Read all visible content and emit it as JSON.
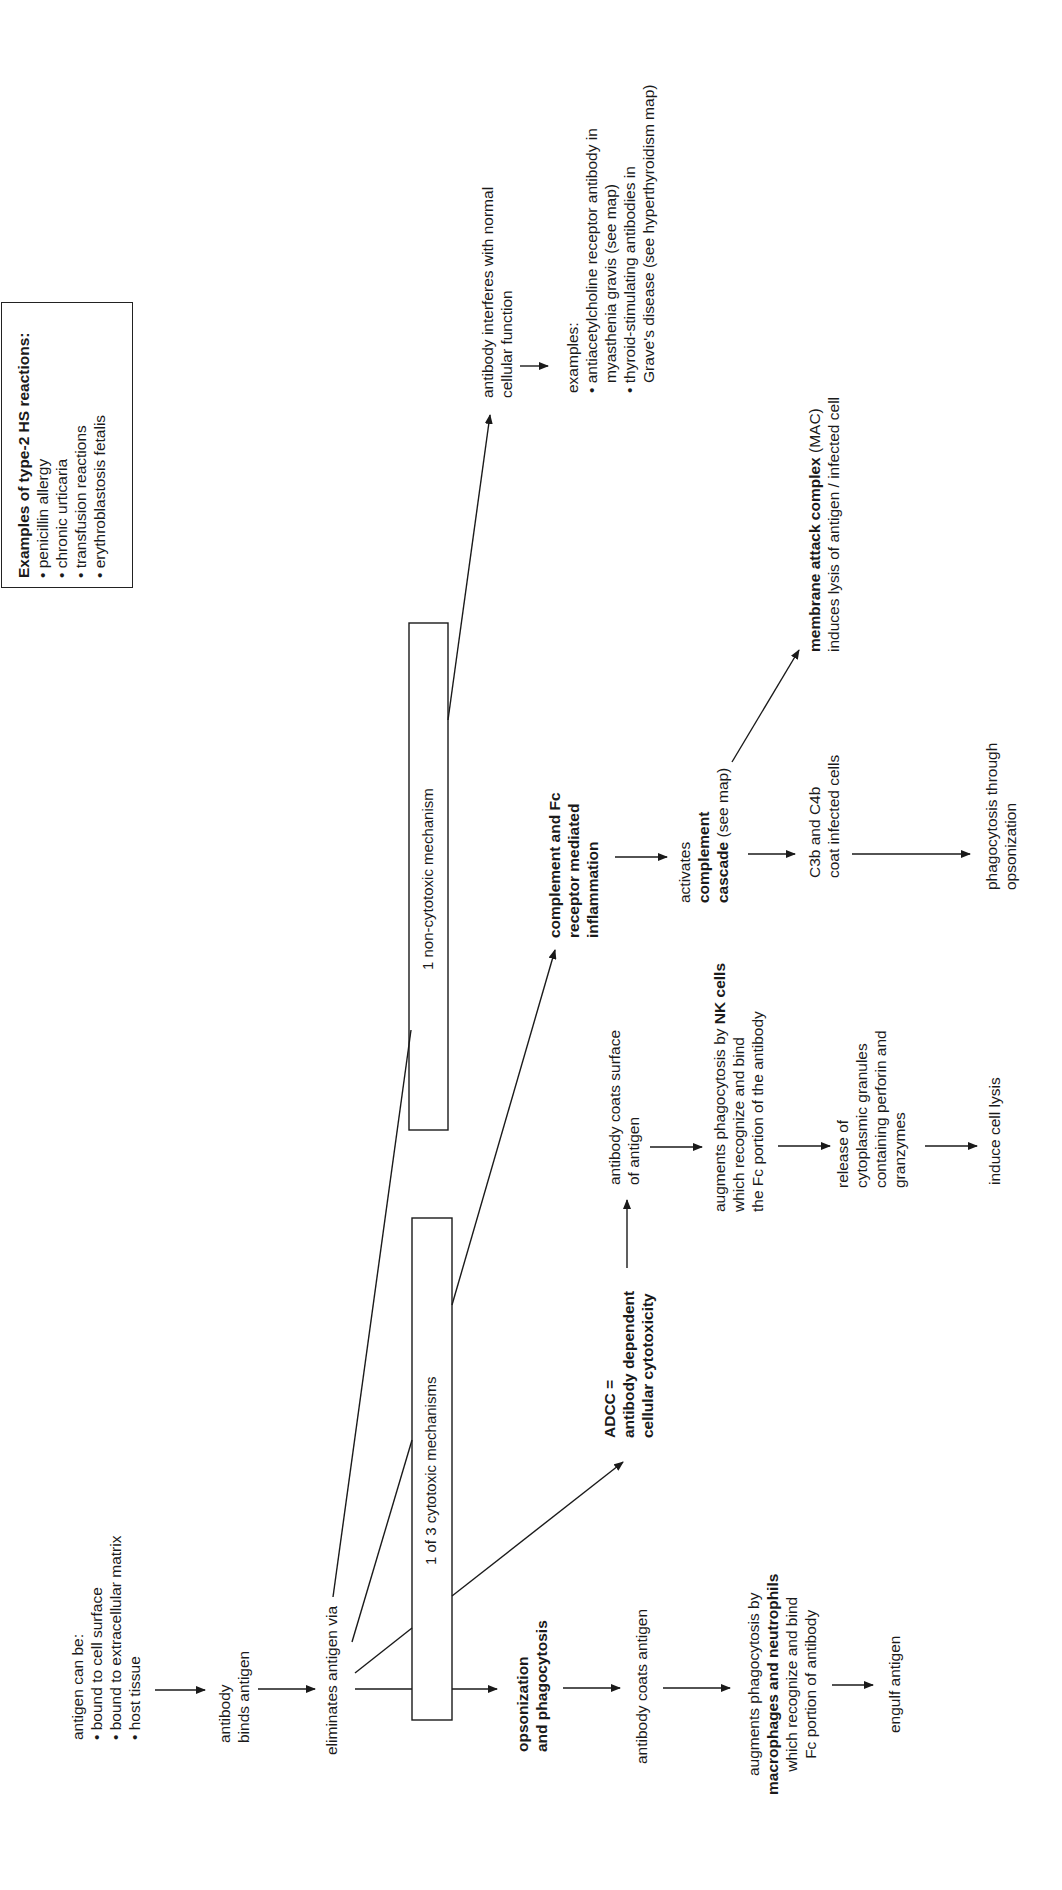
{
  "examples_box": {
    "title": "Examples of type-2 HS reactions:",
    "items": [
      "• penicillin allergy",
      "• chronic urticaria",
      "• transfusion reactions",
      "• erythroblastosis fetalis"
    ]
  },
  "start": {
    "title": "antigen can be:",
    "items": [
      "• bound to cell surface",
      "• bound to extracellular matrix",
      "• host tissue"
    ]
  },
  "binds": {
    "line1": "antibody",
    "line2": "binds antigen"
  },
  "eliminates": {
    "label": "eliminates antigen via"
  },
  "boxes": {
    "cytotoxic": "1 of 3 cytotoxic mechanisms",
    "noncytotoxic": "1 non-cytotoxic mechanism"
  },
  "opsonization": {
    "title1": "opsonization",
    "title2": "and phagocytosis",
    "step1": "antibody coats antigen",
    "step2_line1": "augments phagocytosis by",
    "step2_bold": "macrophages and neutrophils",
    "step2_line3": "which recognize and bind",
    "step2_line4": "Fc portion of antibody",
    "step3": "engulf antigen"
  },
  "adcc": {
    "title1": "ADCC =",
    "title2": "antibody dependent",
    "title3": "cellular cytotoxicity",
    "step1_line1": "antibody coats surface",
    "step1_line2": "of antigen",
    "step2_line1_pre": "augments phagocytosis by ",
    "step2_line1_bold": "NK cells",
    "step2_line2": "which recognize and bind",
    "step2_line3": "the Fc portion of the antibody",
    "step3_line1": "release of",
    "step3_line2": "cytoplasmic granules",
    "step3_line3": "containing perforin and",
    "step3_line4": "granzymes",
    "step4": "induce cell lysis"
  },
  "complement": {
    "title1": "complement and Fc",
    "title2": "receptor mediated",
    "title3": "inflammation",
    "step1_line1": "activates",
    "step1_line2": "complement",
    "step1_line3_bold": "cascade",
    "step1_line3_rest": " (see map)",
    "mac_bold": "membrane attack complex",
    "mac_rest": " (MAC)",
    "mac_line2": "induces lysis of antigen / infected cell",
    "c3b_line1": "C3b and C4b",
    "c3b_line2": "coat infected cells",
    "phago_line1": "phagocytosis through",
    "phago_line2": "opsonization"
  },
  "noncytotoxic": {
    "line1": "antibody interferes with normal",
    "line2": "cellular function",
    "examples_title": "examples:",
    "ex1_line1": "• antiacetylcholine receptor antibody in",
    "ex1_line2": "myasthenia gravis (see map)",
    "ex2_line1": "• thyroid-stimulating antibodies in",
    "ex2_line2": "Grave's disease (see hyperthyroidism map)"
  }
}
